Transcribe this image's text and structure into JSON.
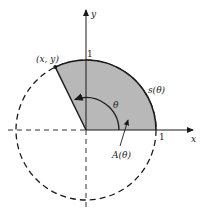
{
  "figure": {
    "labels": {
      "point": "(x, y)",
      "y_axis": "y",
      "x_axis": "x",
      "y_tick": "1",
      "x_tick": "1",
      "arc_length": "s(θ)",
      "angle": "θ",
      "area": "A(θ)"
    },
    "colors": {
      "sector_fill": "#b8b8b8",
      "stroke": "#1a1a1a",
      "background": "#ffffff"
    },
    "geometry": {
      "center_px": [
        86,
        130
      ],
      "radius_px": 70,
      "theta_deg": 116
    }
  }
}
